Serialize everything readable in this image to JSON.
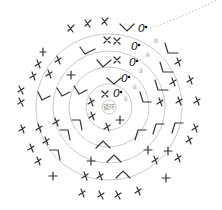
{
  "diagram": {
    "title": "",
    "center_label": "锁环",
    "round_labels": [
      "①",
      "②",
      "③",
      "④",
      "⑤"
    ],
    "start_chain_symbol": "0",
    "legend_note": "",
    "colors": {
      "ring": "#c8c8c8",
      "symbol": "#333333",
      "tail": "#bbbbbb"
    },
    "rings_radii": [
      7,
      23,
      40,
      56,
      73
    ],
    "center": [
      109,
      107
    ]
  }
}
